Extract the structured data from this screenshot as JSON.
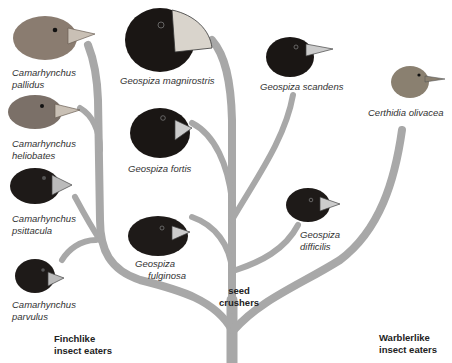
{
  "diagram": {
    "type": "phylogenetic-tree",
    "branch_color": "#a8a8a8",
    "species": [
      {
        "id": "pallidus",
        "genus": "Camarhynchus",
        "epithet": "pallidus",
        "line1": "Camarhynchus",
        "line2": "pallidus",
        "plumage": "#8a7c70"
      },
      {
        "id": "heliobates",
        "genus": "Camarhynchus",
        "epithet": "heliobates",
        "line1": "Camarhynchus",
        "line2": "heliobates",
        "plumage": "#7b7068"
      },
      {
        "id": "psittacula",
        "genus": "Camarhynchus",
        "epithet": "psittacula",
        "line1": "Camarhynchus",
        "line2": "psittacula",
        "plumage": "#1e1a18"
      },
      {
        "id": "parvulus",
        "genus": "Camarhynchus",
        "epithet": "parvulus",
        "line1": "Camarhynchus",
        "line2": "parvulus",
        "plumage": "#1e1a18"
      },
      {
        "id": "magnirostris",
        "genus": "Geospiza",
        "epithet": "magnirostris",
        "line1": "Geospiza magnirostris",
        "plumage": "#1a1614"
      },
      {
        "id": "fortis",
        "genus": "Geospiza",
        "epithet": "fortis",
        "line1": "Geospiza fortis",
        "plumage": "#1a1614"
      },
      {
        "id": "fulginosa",
        "genus": "Geospiza",
        "epithet": "fulginosa",
        "line1": "Geospiza",
        "line2": "fulginosa",
        "plumage": "#1e1a18"
      },
      {
        "id": "scandens",
        "genus": "Geospiza",
        "epithet": "scandens",
        "line1": "Geospiza scandens",
        "plumage": "#1a1614"
      },
      {
        "id": "difficilis",
        "genus": "Geospiza",
        "epithet": "difficilis",
        "line1": "Geospiza",
        "line2": "difficilis",
        "plumage": "#1e1a18"
      },
      {
        "id": "olivacea",
        "genus": "Certhidia",
        "epithet": "olivacea",
        "line1": "Certhidia olivacea",
        "plumage": "#8a8070"
      }
    ],
    "groups": [
      {
        "id": "finchlike",
        "line1": "Finchlike",
        "line2": "insect eaters"
      },
      {
        "id": "seed",
        "line1": "seed",
        "line2": "crushers"
      },
      {
        "id": "warblerlike",
        "line1": "Warblerlike",
        "line2": "insect eaters"
      }
    ]
  }
}
